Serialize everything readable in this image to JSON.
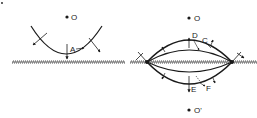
{
  "diagram": {
    "colors": {
      "ink": "#1a1a1a",
      "background": "#ffffff",
      "hatch": "#555555"
    },
    "left_panel": {
      "center_label": "O",
      "arrow_label": "A"
    },
    "right_panel": {
      "top_center_label": "O",
      "bottom_center_label": "O'",
      "labels": [
        "D",
        "C",
        "E",
        "F"
      ]
    },
    "corner_mark": "•"
  }
}
